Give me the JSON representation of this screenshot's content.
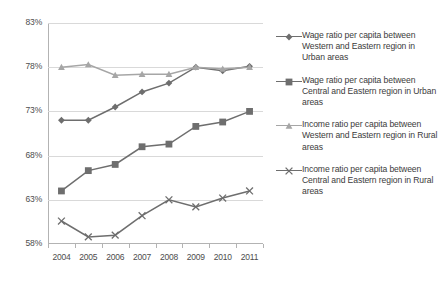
{
  "chart_data": {
    "type": "line",
    "title": "",
    "xlabel": "",
    "ylabel": "",
    "categories": [
      "2004",
      "2005",
      "2006",
      "2007",
      "2008",
      "2009",
      "2010",
      "2011"
    ],
    "ylim": [
      58,
      83
    ],
    "ytick_labels": [
      "83%",
      "78%",
      "73%",
      "68%",
      "63%",
      "58%"
    ],
    "ytick_values": [
      83,
      78,
      73,
      68,
      63,
      58
    ],
    "grid": true,
    "legend_position": "right",
    "value_suffix": "%",
    "series": [
      {
        "name": "Wage ratio per capita between Western and Eastern region in Urban areas",
        "marker": "diamond",
        "color": "#6e6e6e",
        "values": [
          72.0,
          72.0,
          73.5,
          75.2,
          76.2,
          78.0,
          77.6,
          78.1
        ]
      },
      {
        "name": "Wage ratio per capita between Central and Eastern region in Urban areas",
        "marker": "square",
        "color": "#6e6e6e",
        "values": [
          64.0,
          66.3,
          67.0,
          69.0,
          69.3,
          71.3,
          71.8,
          73.0
        ]
      },
      {
        "name": "Income ratio per capita between Western and Eastern region in Rural areas",
        "marker": "triangle",
        "color": "#a6a6a6",
        "values": [
          78.0,
          78.3,
          77.1,
          77.2,
          77.2,
          78.0,
          77.8,
          78.0
        ]
      },
      {
        "name": "Income ratio per capita between Central and Eastern region in Rural areas",
        "marker": "cross",
        "color": "#6e6e6e",
        "values": [
          60.6,
          58.8,
          59.0,
          61.2,
          63.0,
          62.2,
          63.2,
          64.0
        ]
      }
    ]
  },
  "legend": {
    "items": [
      {
        "label": "Wage ratio per capita between Western and Eastern region in Urban areas",
        "marker": "diamond",
        "color": "#6e6e6e"
      },
      {
        "label": "Wage ratio per capita between Central and Eastern region in Urban areas",
        "marker": "square",
        "color": "#6e6e6e"
      },
      {
        "label": "Income ratio per capita between Western and Eastern region in Rural areas",
        "marker": "triangle",
        "color": "#a6a6a6"
      },
      {
        "label": "Income ratio per capita between Central and Eastern region in Rural areas",
        "marker": "cross",
        "color": "#6e6e6e"
      }
    ]
  },
  "colors": {
    "grid": "#d9d9d9",
    "axis": "#b3b3b3",
    "text": "#4d4d4d",
    "dark_series": "#6e6e6e",
    "light_series": "#a6a6a6"
  }
}
